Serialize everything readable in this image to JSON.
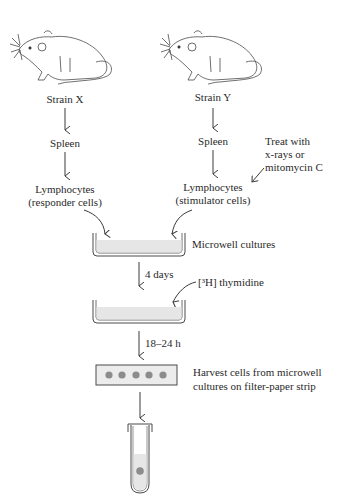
{
  "diagram": {
    "left_column": {
      "strain": "Strain X",
      "organ": "Spleen",
      "cells_line1": "Lymphocytes",
      "cells_line2": "(responder cells)"
    },
    "right_column": {
      "strain": "Strain Y",
      "organ": "Spleen",
      "cells_line1": "Lymphocytes",
      "cells_line2": "(stimulator cells)"
    },
    "treatment": {
      "line1": "Treat with",
      "line2": "x-rays or",
      "line3": "mitomycin C"
    },
    "culture_label": "Microwell cultures",
    "step1_label": "4 days",
    "thymidine_label": "[³H] thymidine",
    "step2_label": "18–24 h",
    "harvest": {
      "line1": "Harvest cells from microwell",
      "line2": "cultures on filter-paper strip"
    },
    "colors": {
      "line": "#3a3a3a",
      "fluid": "#e6e6e6",
      "strip_fill": "#ececec",
      "dot": "#8c8c8c"
    }
  }
}
